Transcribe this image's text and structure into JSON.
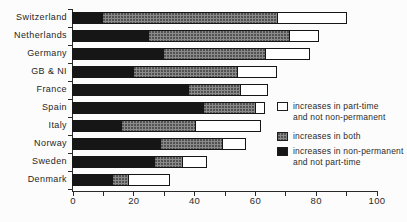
{
  "chart_data": {
    "type": "bar",
    "orientation": "horizontal",
    "stacked": true,
    "title": "",
    "categories": [
      "Switzerland",
      "Netherlands",
      "Germany",
      "GB & NI",
      "France",
      "Spain",
      "Italy",
      "Norway",
      "Sweden",
      "Denmark"
    ],
    "series": [
      {
        "name": "increases in non-permanent and not part-time",
        "swatch": "black",
        "color": "#161616",
        "values": [
          10,
          25,
          30,
          20,
          38,
          43,
          16,
          29,
          27,
          13
        ]
      },
      {
        "name": "increases in both",
        "swatch": "gray",
        "color": "#8a8a8a",
        "values": [
          57,
          46,
          33,
          34,
          17,
          17,
          24,
          20,
          9,
          5
        ]
      },
      {
        "name": "increases in part-time and not non-permanent",
        "swatch": "white",
        "color": "#ffffff",
        "values": [
          23,
          10,
          15,
          13,
          9,
          3,
          22,
          8,
          8,
          14
        ]
      }
    ],
    "xlim": [
      0,
      100
    ],
    "x_tick_labels": [
      "0",
      "20",
      "40",
      "60",
      "80",
      "100"
    ],
    "minor_tick_step": 10,
    "grid": false,
    "legend_position": "right-middle",
    "legend": [
      {
        "swatch": "white",
        "line1": "increases in part-time",
        "line2": "and not non-permanent"
      },
      {
        "swatch": "gray",
        "line1": "increases in both",
        "line2": ""
      },
      {
        "swatch": "black",
        "line1": "increases in non-permanent",
        "line2": "and not part-time"
      }
    ],
    "colors": {
      "bar_black": "#161616",
      "bar_gray": "#8a8a8a",
      "outline": "#161616",
      "background": "#fcfcfc",
      "text": "#2b2b2b"
    }
  }
}
